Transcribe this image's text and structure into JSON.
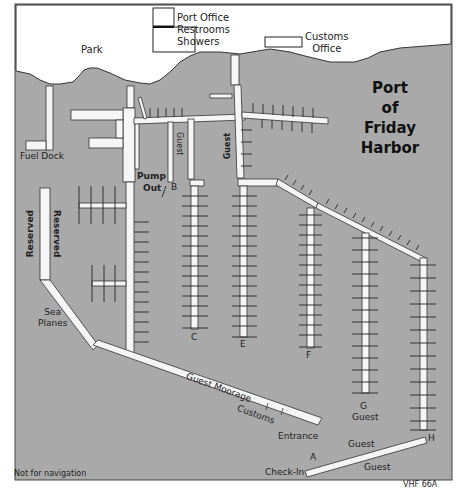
{
  "map": {
    "title_lines": [
      "Port",
      "of",
      "Friday",
      "Harbor"
    ],
    "colors": {
      "water": "#a9a9a9",
      "land": "#ffffff",
      "dock": "#f4f4f4",
      "outline": "#333333"
    },
    "buildings": {
      "port_office": [
        "Port Office",
        "Restrooms",
        "Showers"
      ],
      "customs_office": [
        "Customs",
        "Office"
      ]
    },
    "land_labels": {
      "park": "Park"
    },
    "dock_labels": {
      "fuel_dock": "Fuel Dock",
      "pump_out": [
        "Pump",
        "Out"
      ],
      "reserved_left": "Reserved",
      "reserved_right": "Reserved",
      "sea_planes": [
        "Sea",
        "Planes"
      ],
      "guest_b": "Guest",
      "guest_d": "Guest",
      "guest_moorage": "Guest Moorage",
      "customs": "Customs",
      "entrance": "Entrance",
      "guest_g": "Guest",
      "guest_a_upper": "Guest",
      "guest_a_lower": "Guest",
      "check_in": "Check-In"
    },
    "pier_letters": {
      "A": "A",
      "B": "B",
      "C": "C",
      "E": "E",
      "F": "F",
      "G": "G",
      "H": "H"
    },
    "footer": {
      "disclaimer": "Not for navigation",
      "radio": "VHF 66A"
    }
  }
}
